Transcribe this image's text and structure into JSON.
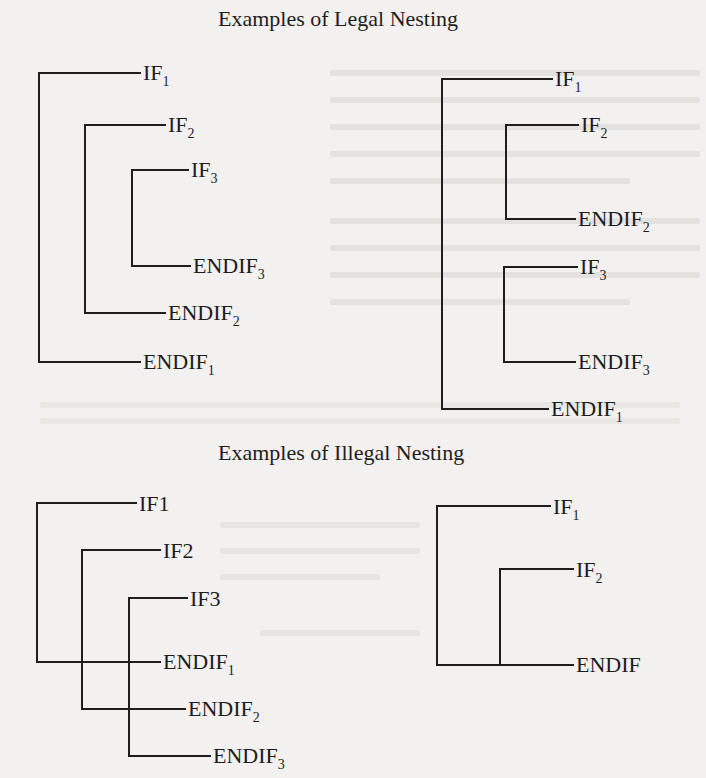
{
  "figure": {
    "legal_section": {
      "title": "Examples of Legal Nesting",
      "diagrams": [
        {
          "id": "legal-nested",
          "labels": [
            {
              "base": "IF",
              "sub": "1"
            },
            {
              "base": "IF",
              "sub": "2"
            },
            {
              "base": "IF",
              "sub": "3"
            },
            {
              "base": "ENDIF",
              "sub": "3"
            },
            {
              "base": "ENDIF",
              "sub": "2"
            },
            {
              "base": "ENDIF",
              "sub": "1"
            }
          ]
        },
        {
          "id": "legal-sequential",
          "labels": [
            {
              "base": "IF",
              "sub": "1"
            },
            {
              "base": "IF",
              "sub": "2"
            },
            {
              "base": "ENDIF",
              "sub": "2"
            },
            {
              "base": "IF",
              "sub": "3"
            },
            {
              "base": "ENDIF",
              "sub": "3"
            },
            {
              "base": "ENDIF",
              "sub": "1"
            }
          ]
        }
      ]
    },
    "illegal_section": {
      "title": "Examples of Illegal Nesting",
      "diagrams": [
        {
          "id": "illegal-crossed",
          "labels": [
            {
              "base": "IF1",
              "sub": ""
            },
            {
              "base": "IF2",
              "sub": ""
            },
            {
              "base": "IF3",
              "sub": ""
            },
            {
              "base": "ENDIF",
              "sub": "1"
            },
            {
              "base": "ENDIF",
              "sub": "2"
            },
            {
              "base": "ENDIF",
              "sub": "3"
            }
          ]
        },
        {
          "id": "illegal-shared-endif",
          "labels": [
            {
              "base": "IF",
              "sub": "1"
            },
            {
              "base": "IF",
              "sub": "2"
            },
            {
              "base": "ENDIF",
              "sub": ""
            }
          ]
        }
      ]
    }
  }
}
